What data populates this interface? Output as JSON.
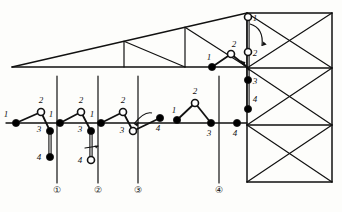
{
  "diagram": {
    "colors": {
      "line": "#111111",
      "filled_node": "#000000",
      "open_node": "#ffffff",
      "background": "#fdfdfb"
    },
    "truss": {
      "name": "triangular-roof-truss",
      "description": "Long shallow triangular truss with interior web bracing, apex at right",
      "bottom_chord_y": 67,
      "apex_x": 247,
      "apex_y": 13,
      "left_tip_x": 12,
      "web_verticals_x": [
        124,
        185
      ],
      "top_chord_from": [
        12,
        67
      ],
      "top_chord_to": [
        247,
        13
      ]
    },
    "tower": {
      "name": "lattice-crane-tower",
      "left_x": 247,
      "right_x": 332,
      "top_y": 13,
      "bottom_y": 182,
      "panel_lines_y": [
        13,
        68,
        125,
        182
      ],
      "bracing": "X-braced panels"
    },
    "ground_line_y": 123,
    "stage_posts": [
      {
        "id": "post-1",
        "x": 57,
        "top_y": 76,
        "bottom_y": 183,
        "marker": "①"
      },
      {
        "id": "post-2",
        "x": 98,
        "top_y": 76,
        "bottom_y": 183,
        "marker": "②"
      },
      {
        "id": "post-3",
        "x": 138,
        "top_y": 76,
        "bottom_y": 183,
        "marker": "③"
      },
      {
        "id": "post-4",
        "x": 219,
        "top_y": 76,
        "bottom_y": 183,
        "marker": "④"
      }
    ],
    "stage_markers": [
      {
        "label": "①",
        "x": 57,
        "y": 193
      },
      {
        "label": "②",
        "x": 98,
        "y": 193
      },
      {
        "label": "③",
        "x": 138,
        "y": 193
      },
      {
        "label": "④",
        "x": 219,
        "y": 193
      }
    ],
    "joint_groups": [
      {
        "name": "group-stage-1",
        "nodes": [
          {
            "label": "1",
            "x": 16,
            "y": 123,
            "type": "filled",
            "label_dx": -10,
            "label_dy": -6
          },
          {
            "label": "2",
            "x": 41,
            "y": 112,
            "type": "open",
            "label_dx": 0,
            "label_dy": -9
          },
          {
            "label": "3",
            "x": 50,
            "y": 131,
            "type": "filled",
            "label_dx": -11,
            "label_dy": 1
          },
          {
            "label": "4",
            "x": 50,
            "y": 157,
            "type": "filled",
            "label_dx": -11,
            "label_dy": 3
          }
        ],
        "links": [
          [
            0,
            1
          ],
          [
            1,
            2
          ]
        ],
        "double_link": [
          2,
          3
        ],
        "arrow": null
      },
      {
        "name": "group-stage-2",
        "nodes": [
          {
            "label": "1",
            "x": 60,
            "y": 123,
            "type": "filled",
            "label_dx": -9,
            "label_dy": -6
          },
          {
            "label": "2",
            "x": 81,
            "y": 112,
            "type": "open",
            "label_dx": 0,
            "label_dy": -9
          },
          {
            "label": "3",
            "x": 91,
            "y": 131,
            "type": "filled",
            "label_dx": -11,
            "label_dy": 1
          },
          {
            "label": "4",
            "x": 91,
            "y": 160,
            "type": "open",
            "label_dx": -11,
            "label_dy": 3
          }
        ],
        "links": [
          [
            0,
            1
          ],
          [
            1,
            2
          ]
        ],
        "double_link": [
          2,
          3
        ],
        "arrow": {
          "type": "rotation-tick",
          "x": 91,
          "y": 148
        }
      },
      {
        "name": "group-stage-3",
        "nodes": [
          {
            "label": "1",
            "x": 101,
            "y": 123,
            "type": "filled",
            "label_dx": -9,
            "label_dy": -6
          },
          {
            "label": "2",
            "x": 123,
            "y": 112,
            "type": "open",
            "label_dx": 0,
            "label_dy": -9
          },
          {
            "label": "3",
            "x": 133,
            "y": 131,
            "type": "open",
            "label_dx": -11,
            "label_dy": 2
          },
          {
            "label": "4",
            "x": 160,
            "y": 118,
            "type": "filled",
            "label_dx": -2,
            "label_dy": 13
          }
        ],
        "links": [
          [
            0,
            1
          ],
          [
            1,
            2
          ],
          [
            2,
            3
          ]
        ],
        "double_link": null,
        "arrow": {
          "type": "curved-swing",
          "x": 148,
          "y": 115
        }
      },
      {
        "name": "group-stage-4",
        "nodes": [
          {
            "label": "1",
            "x": 177,
            "y": 120,
            "type": "filled",
            "label_dx": -3,
            "label_dy": -7
          },
          {
            "label": "2",
            "x": 195,
            "y": 103,
            "type": "open",
            "label_dx": 0,
            "label_dy": -9
          },
          {
            "label": "3",
            "x": 211,
            "y": 123,
            "type": "filled",
            "label_dx": -2,
            "label_dy": 13
          },
          {
            "label": "4",
            "x": 237,
            "y": 123,
            "type": "filled",
            "label_dx": -2,
            "label_dy": 13
          }
        ],
        "links": [
          [
            0,
            1
          ],
          [
            1,
            2
          ]
        ],
        "double_link": null,
        "arrow": null
      }
    ],
    "hoist_group": {
      "name": "group-hoisted-member",
      "nodes": [
        {
          "label": "1",
          "x": 248,
          "y": 17,
          "type": "open",
          "label_dx": 7,
          "label_dy": 4
        },
        {
          "label": "2",
          "x": 248,
          "y": 52,
          "type": "open",
          "label_dx": 7,
          "label_dy": 4
        },
        {
          "label": "3",
          "x": 248,
          "y": 80,
          "type": "filled",
          "label_dx": 7,
          "label_dy": 4
        },
        {
          "label": "4",
          "x": 248,
          "y": 109,
          "type": "filled",
          "label_dx": 7,
          "label_dy": -7
        }
      ],
      "double_link_pairs": [
        [
          0,
          1
        ],
        [
          2,
          3
        ]
      ],
      "swing_arrow": {
        "from_x": 250,
        "from_y": 24,
        "to_x": 262,
        "to_y": 46
      }
    },
    "truss_joint_nodes": [
      {
        "label": "1",
        "x": 212,
        "y": 67,
        "type": "filled",
        "label_dx": -3,
        "label_dy": -7
      },
      {
        "label": "2",
        "x": 231,
        "y": 54,
        "type": "open",
        "label_dx": 3,
        "label_dy": -7
      }
    ],
    "truss_joint_links": [
      [
        0,
        1
      ]
    ],
    "pick_point": {
      "x": 247,
      "y": 67,
      "arrow_to_x": 241,
      "arrow_to_y": 61
    }
  }
}
